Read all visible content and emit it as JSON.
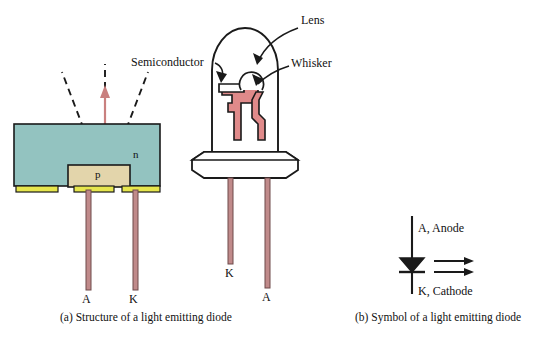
{
  "figure": {
    "panels": [
      {
        "id": "a",
        "caption": "(a) Structure of a light emitting diode"
      },
      {
        "id": "b",
        "caption": "(b) Symbol of a light emitting diode"
      }
    ]
  },
  "structure": {
    "region_n_label": "n",
    "region_p_label": "p",
    "terminal_anode": "A",
    "terminal_cathode": "K",
    "light_arrow_name": "emitted-light"
  },
  "package": {
    "label_lens": "Lens",
    "label_semiconductor": "Semiconductor",
    "label_whisker": "Whisker",
    "lead_cathode": "K",
    "lead_anode": "A"
  },
  "symbol": {
    "anode_label": "A, Anode",
    "cathode_label": "K, Cathode"
  },
  "colors": {
    "n_region": "#93c3c0",
    "p_region": "#e3d5ab",
    "contact_strip": "#e6e64d",
    "lead_wire": "#c08a8a",
    "die_red": "#e08a8a",
    "outline": "#1a1a1a",
    "background": "#ffffff",
    "light_arrow": "#c9807f"
  }
}
